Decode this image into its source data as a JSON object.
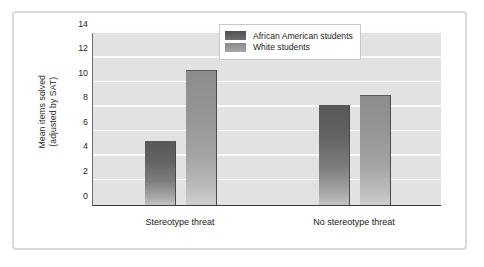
{
  "chart_data": {
    "type": "bar",
    "title": "",
    "subtitle": "",
    "xlabel": "",
    "ylabel": "Mean items solved\n(adjusted by SAT)",
    "categories": [
      "Stereotype threat",
      "No stereotype threat"
    ],
    "series": [
      {
        "name": "African American students",
        "values": [
          5.1,
          8.1
        ],
        "color": "#626262"
      },
      {
        "name": "White students",
        "values": [
          10.9,
          8.9
        ],
        "color": "#9a9a9a"
      }
    ],
    "ylim": [
      0,
      14
    ],
    "ytick_step": 2,
    "ytick_labels": [
      "0",
      "2",
      "4",
      "6",
      "8",
      "10",
      "12",
      "14"
    ],
    "grid": true,
    "grid_axis": "y",
    "grid_color": "#fbfbfb",
    "plot_background": "#e2e2e2",
    "legend_position": "top-right",
    "frame_color": "#d9dadb"
  }
}
